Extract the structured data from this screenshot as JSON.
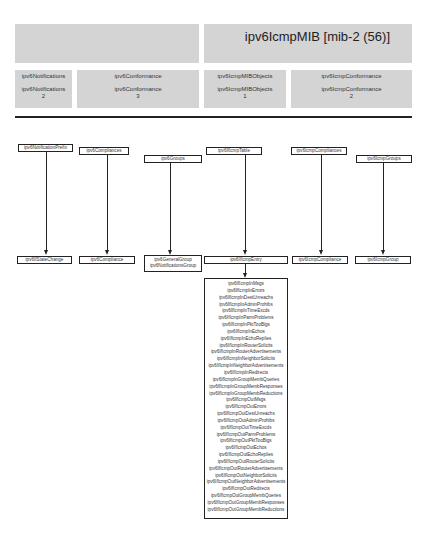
{
  "header": {
    "title": "ipv6IcmpMIB [mib-2 (56)]",
    "cells": [
      {
        "name": "ipv6Notifications",
        "line1": "ipv6Notifications",
        "line2": "ipv6Notifications",
        "line3": "2"
      },
      {
        "name": "ipv6Conformance",
        "line1": "ipv6Conformance",
        "line2": "ipv6Conformance",
        "line3": "3"
      },
      {
        "name": "ipv6IcmpMIBObjects",
        "line1": "ipv6IcmpMIBObjects",
        "line2": "ipv6IcmpMIBObjects",
        "line3": "1"
      },
      {
        "name": "ipv6IcmpConformance",
        "line1": "ipv6IcmpConformance",
        "line2": "ipv6IcmpConformance",
        "line3": "2"
      }
    ]
  },
  "diagram": {
    "top_nodes": [
      "ipv6NotificationPrefix",
      "ipv6Compliances",
      "ipv6Groups",
      "ipv6IfIcmpTable",
      "ipv6IcmpCompliances",
      "ipv6IcmpGroups"
    ],
    "bottom_nodes": [
      "ipv6IfStateChange",
      "ipv6Compliance",
      "ipv6GeneralGroup",
      "ipv6NotificationsGroup",
      "ipv6IfIcmpEntry",
      "ipv6IcmpCompliance",
      "ipv6IcmpGroup"
    ],
    "entry_columns": [
      "ipv6IfIcmpInMsgs",
      "ipv6IfIcmpInErrors",
      "ipv6IfIcmpInDestUnreachs",
      "ipv6IfIcmpInAdminProhibs",
      "ipv6IfIcmpInTimeExcds",
      "ipv6IfIcmpInParmProblems",
      "ipv6IfIcmpInPktTooBigs",
      "ipv6IfIcmpInEchos",
      "ipv6IfIcmpInEchoReplies",
      "ipv6IfIcmpInRouterSolicits",
      "ipv6IfIcmpInRouterAdvertisements",
      "ipv6IfIcmpInNeighborSolicits",
      "ipv6IfIcmpInNeighborAdvertisements",
      "ipv6IfIcmpInRedirects",
      "ipv6IfIcmpInGroupMembQueries",
      "ipv6IfIcmpInGroupMembResponses",
      "ipv6IfIcmpInGroupMembReductions",
      "ipv6IfIcmpOutMsgs",
      "ipv6IfIcmpOutErrors",
      "ipv6IfIcmpOutDestUnreachs",
      "ipv6IfIcmpOutAdminProhibs",
      "ipv6IfIcmpOutTimeExcds",
      "ipv6IfIcmpOutParmProblems",
      "ipv6IfIcmpOutPktTooBigs",
      "ipv6IfIcmpOutEchos",
      "ipv6IfIcmpOutEchoReplies",
      "ipv6IfIcmpOutRouterSolicits",
      "ipv6IfIcmpOutRouterAdvertisements",
      "ipv6IfIcmpOutNeighborSolicits",
      "ipv6IfIcmpOutNeighborAdvertisements",
      "ipv6IfIcmpOutRedirects",
      "ipv6IfIcmpOutGroupMembQueries",
      "ipv6IfIcmpOutGroupMembResponses",
      "ipv6IfIcmpOutGroupMembReductions"
    ]
  }
}
